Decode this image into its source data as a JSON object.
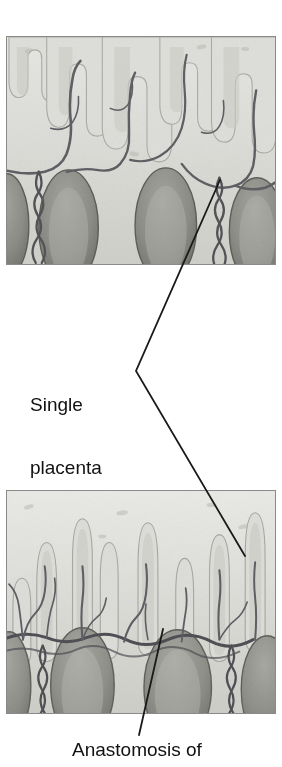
{
  "figure": {
    "type": "medical-illustration",
    "background_color": "#ffffff",
    "line_color": "#1a1a1a",
    "panel_border_color": "#8a8a8a"
  },
  "labels": {
    "single_placenta": "Single\nplacenta",
    "single_placenta_line1": "Single",
    "single_placenta_line2": "placenta",
    "anastomosis": "Anastomosis of"
  },
  "panels": [
    {
      "id": "panel-top",
      "name": "placenta-cross-section-top",
      "x": 6,
      "y": 36,
      "width": 270,
      "height": 229,
      "description": "Grayscale cross-section of placental tissue with branching chorionic villi and vessels above dark oval cotyledons"
    },
    {
      "id": "panel-bottom",
      "name": "placenta-cross-section-bottom",
      "x": 6,
      "y": 490,
      "width": 270,
      "height": 224,
      "description": "Grayscale cross-section of placental tissue showing vascular anastomosis between villous trees"
    }
  ],
  "leaders": [
    {
      "name": "leader-top-panel",
      "points": "220,180 136,371"
    },
    {
      "name": "leader-bracket",
      "points": "136,371 245,556"
    },
    {
      "name": "leader-anastomosis",
      "points": "163,629 139,735"
    }
  ],
  "colors": {
    "tissue_light": "#e2e2df",
    "tissue_mid": "#c9c9c4",
    "tissue_dark": "#9a9a94",
    "cotyledon": "#7e7e78",
    "vessel": "#55555a",
    "vessel_dark": "#3d3d42",
    "text": "#111111"
  }
}
